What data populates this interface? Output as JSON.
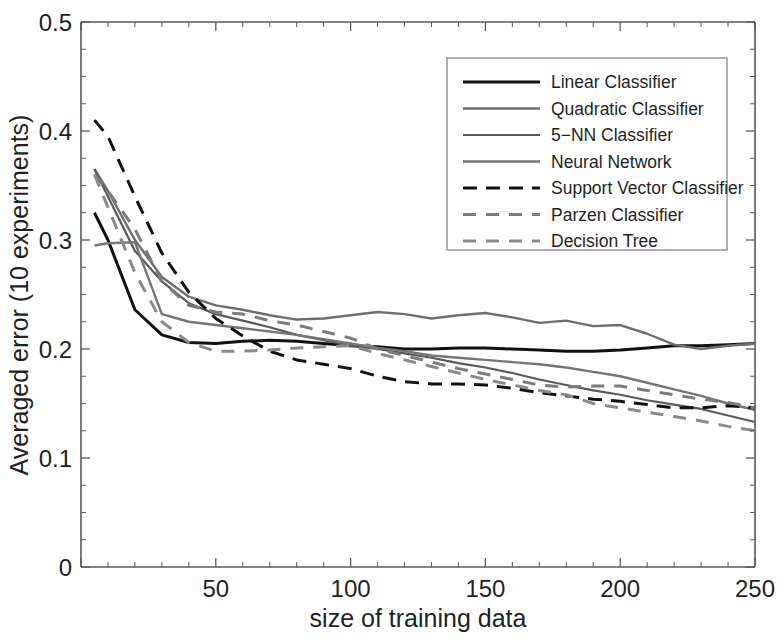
{
  "chart_data": {
    "type": "line",
    "title": "",
    "xlabel": "size of training data",
    "ylabel": "Averaged error (10 experiments)",
    "xlim": [
      0,
      250
    ],
    "ylim": [
      0,
      0.5
    ],
    "xticks": [
      0,
      50,
      100,
      150,
      200,
      250
    ],
    "xtick_labels": [
      "0",
      "50",
      "100",
      "150",
      "200",
      "250"
    ],
    "yticks": [
      0,
      0.1,
      0.2,
      0.3,
      0.4,
      0.5
    ],
    "ytick_labels": [
      "0",
      "0.1",
      "0.2",
      "0.3",
      "0.4",
      "0.5"
    ],
    "xtick_minor_step": 10,
    "ytick_minor_step": 0.025,
    "grid": false,
    "legend_position": "top-right",
    "x": [
      5,
      10,
      20,
      30,
      40,
      50,
      60,
      70,
      80,
      90,
      100,
      110,
      120,
      130,
      140,
      150,
      160,
      170,
      180,
      190,
      200,
      210,
      220,
      230,
      240,
      250
    ],
    "series": [
      {
        "name": "Linear Classifier",
        "color": "#111111",
        "width": 3.0,
        "dash": "solid",
        "values": [
          0.325,
          0.3,
          0.236,
          0.213,
          0.206,
          0.205,
          0.207,
          0.208,
          0.207,
          0.205,
          0.203,
          0.202,
          0.2,
          0.2,
          0.201,
          0.201,
          0.2,
          0.199,
          0.198,
          0.198,
          0.199,
          0.201,
          0.203,
          0.203,
          0.204,
          0.205
        ]
      },
      {
        "name": "Quadratic Classifier",
        "color": "#6e6e6e",
        "width": 2.4,
        "dash": "solid",
        "values": [
          0.365,
          0.345,
          0.3,
          0.266,
          0.248,
          0.24,
          0.236,
          0.231,
          0.227,
          0.228,
          0.231,
          0.234,
          0.232,
          0.228,
          0.231,
          0.233,
          0.229,
          0.224,
          0.226,
          0.221,
          0.222,
          0.214,
          0.204,
          0.2,
          0.203,
          0.205
        ]
      },
      {
        "name": "5-NN Classifier",
        "color": "#595959",
        "width": 2.2,
        "dash": "solid",
        "values": [
          0.365,
          0.34,
          0.29,
          0.262,
          0.242,
          0.232,
          0.226,
          0.22,
          0.213,
          0.208,
          0.203,
          0.2,
          0.196,
          0.192,
          0.187,
          0.183,
          0.178,
          0.172,
          0.167,
          0.162,
          0.158,
          0.153,
          0.149,
          0.145,
          0.139,
          0.133
        ]
      },
      {
        "name": "Neural Network",
        "color": "#757575",
        "width": 2.4,
        "dash": "solid",
        "values": [
          0.295,
          0.297,
          0.298,
          0.232,
          0.225,
          0.222,
          0.219,
          0.216,
          0.213,
          0.209,
          0.205,
          0.201,
          0.198,
          0.194,
          0.192,
          0.19,
          0.188,
          0.186,
          0.183,
          0.179,
          0.175,
          0.169,
          0.163,
          0.157,
          0.15,
          0.144
        ]
      },
      {
        "name": "Support Vector Classifier",
        "color": "#111111",
        "width": 3.0,
        "dash": "14,9",
        "values": [
          0.41,
          0.395,
          0.34,
          0.288,
          0.252,
          0.228,
          0.212,
          0.198,
          0.19,
          0.186,
          0.182,
          0.175,
          0.17,
          0.168,
          0.168,
          0.167,
          0.164,
          0.16,
          0.157,
          0.154,
          0.152,
          0.149,
          0.146,
          0.146,
          0.148,
          0.146
        ]
      },
      {
        "name": "Parzen Classifier",
        "color": "#7b7b7b",
        "width": 3.0,
        "dash": "13,10",
        "values": [
          0.36,
          0.345,
          0.31,
          0.262,
          0.24,
          0.234,
          0.232,
          0.226,
          0.222,
          0.216,
          0.21,
          0.2,
          0.194,
          0.188,
          0.182,
          0.177,
          0.172,
          0.167,
          0.165,
          0.166,
          0.166,
          0.162,
          0.158,
          0.154,
          0.151,
          0.146
        ]
      },
      {
        "name": "Decision Tree",
        "color": "#8a8a8a",
        "width": 3.0,
        "dash": "13,10",
        "values": [
          0.36,
          0.33,
          0.27,
          0.225,
          0.206,
          0.198,
          0.198,
          0.199,
          0.201,
          0.202,
          0.203,
          0.196,
          0.19,
          0.184,
          0.178,
          0.172,
          0.167,
          0.162,
          0.158,
          0.15,
          0.146,
          0.142,
          0.138,
          0.134,
          0.129,
          0.125
        ]
      }
    ]
  },
  "legend": {
    "items": [
      {
        "label": "Linear Classifier"
      },
      {
        "label": "Quadratic Classifier"
      },
      {
        "label": "5−NN Classifier"
      },
      {
        "label": "Neural Network"
      },
      {
        "label": "Support Vector Classifier"
      },
      {
        "label": "Parzen Classifier"
      },
      {
        "label": "Decision Tree"
      }
    ]
  }
}
